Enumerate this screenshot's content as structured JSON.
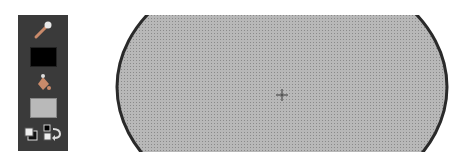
{
  "toolpanel": {
    "tools": [
      {
        "name": "eyedropper-icon"
      },
      {
        "name": "stroke-color-swatch",
        "color": "#000000"
      },
      {
        "name": "paint-bucket-icon"
      },
      {
        "name": "fill-color-swatch",
        "color": "#b9b9b9"
      },
      {
        "name": "default-colors-icon"
      },
      {
        "name": "swap-colors-icon"
      }
    ]
  },
  "canvas": {
    "shape": "ellipse",
    "fill_color": "#b3b3b3",
    "stroke_color": "#2a2a2a",
    "center_marker": "crosshair"
  }
}
